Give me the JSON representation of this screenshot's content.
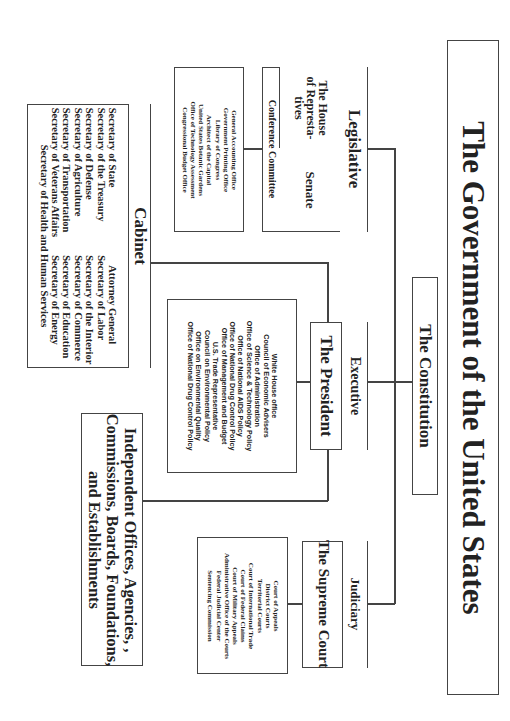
{
  "title": "The Government of the United States",
  "constitution": "The Constitution",
  "legislative": {
    "header": "Legislative",
    "house": "The House of Represta- tives",
    "house_lines": [
      "The House",
      "of Represta-",
      "tives"
    ],
    "senate": "Senate",
    "conference": "Conference Committee",
    "offices": [
      "General Accounting Office",
      "Government Printing Office",
      "Library of Congress",
      "Architect of the Capital",
      "United States Botanic Gardens",
      "Office of Technology Assessment",
      "Congressional Budget Office"
    ]
  },
  "executive": {
    "header": "Executive",
    "president": "The President",
    "offices": [
      "White House office",
      "Council of Economic Advisers",
      "Office of Administration",
      "Office of Science & Technology Policy",
      "Office of National AIDS Policy",
      "Office of National Drug Control Policy",
      "Office of Management and Budget",
      "U.S. Trade Representative",
      "Council on Environmental Policy",
      "Office on Environmental Quality",
      "Office of National Drug Control Policy"
    ]
  },
  "cabinet": {
    "header": "Cabinet",
    "col1": [
      "Secretary of State",
      "Secretary of the Treasury",
      "Secretary of Defense",
      "Secretary of Agriculture",
      "Secretary of Transportation",
      "Secretary of Veterans Affairs"
    ],
    "col2": [
      "Attorney General",
      "Secretary of Labor",
      "Secretary of the Interior",
      "Secretary of Commerce",
      "Secretary of Education",
      "Secretary of Energy"
    ],
    "last": "Secretary of Health and Human Services"
  },
  "judiciary": {
    "header": "Judiciary",
    "court": "The Supreme Court",
    "offices": [
      "Court of Appeals",
      "District Courts",
      "Territorial Courts",
      "Court of International Trade",
      "Court of Federal Claims",
      "Court of Military Appeals",
      "Administrative Office of the Courts",
      "Federal Judicial Center",
      "Sentencing Commission"
    ]
  },
  "independent": {
    "lines": [
      "Independent Offices, Agencies, ,",
      "Commissions, Boards, Foundations,",
      "and Establishments"
    ]
  }
}
